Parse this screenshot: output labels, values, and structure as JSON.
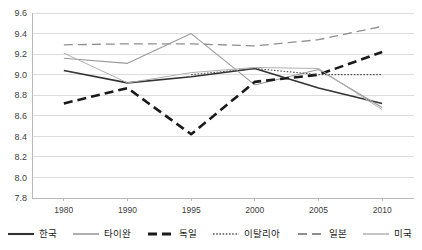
{
  "chart_data": {
    "type": "line",
    "title": "",
    "subtitle": "",
    "xlabel": "",
    "ylabel": "",
    "categories": [
      "1980",
      "1990",
      "1995",
      "2000",
      "2005",
      "2010"
    ],
    "ylim": [
      7.8,
      9.6
    ],
    "ytick_labels": [
      "9.6",
      "9.4",
      "9.2",
      "9.0",
      "8.8",
      "8.6",
      "8.4",
      "8.2",
      "8.0",
      "7.8"
    ],
    "ytick_values": [
      9.6,
      9.4,
      9.2,
      9.0,
      8.8,
      8.6,
      8.4,
      8.2,
      8.0,
      7.8
    ],
    "grid": true,
    "grid_axis": "y",
    "legend_position": "bottom",
    "series": [
      {
        "name": "한국",
        "style": "solid",
        "color": "#333333",
        "width": 1.6,
        "values": [
          9.04,
          8.92,
          8.98,
          9.06,
          8.87,
          8.72
        ]
      },
      {
        "name": "타이완",
        "style": "solid",
        "color": "#9a9a9a",
        "width": 1.1,
        "values": [
          9.16,
          9.11,
          9.4,
          8.9,
          9.05,
          8.68
        ]
      },
      {
        "name": "독일",
        "style": "dashed-heavy",
        "color": "#1a1a1a",
        "width": 2.6,
        "values": [
          8.72,
          8.87,
          8.42,
          8.93,
          9.0,
          9.22
        ]
      },
      {
        "name": "이탈리아",
        "style": "dotted",
        "color": "#555555",
        "width": 1.1,
        "values": [
          null,
          null,
          9.0,
          9.06,
          9.0,
          9.0
        ]
      },
      {
        "name": "일본",
        "style": "dashed-light",
        "color": "#8f8f8f",
        "width": 1.3,
        "values": [
          9.29,
          9.3,
          9.3,
          9.28,
          9.34,
          9.47
        ]
      },
      {
        "name": "미국",
        "style": "solid-thin",
        "color": "#b0b0b0",
        "width": 1.0,
        "values": [
          9.21,
          8.92,
          9.02,
          9.07,
          9.06,
          8.66
        ]
      }
    ]
  },
  "legend": {
    "items": [
      {
        "label": "한국",
        "swatch": "legend-swatch-solid"
      },
      {
        "label": "타이완",
        "swatch": "legend-swatch-solid-light"
      },
      {
        "label": "독일",
        "swatch": "legend-swatch-dashed-heavy"
      },
      {
        "label": "이탈리아",
        "swatch": "legend-swatch-dotted"
      },
      {
        "label": "일본",
        "swatch": "legend-swatch-dashed-light"
      },
      {
        "label": "미국",
        "swatch": "legend-swatch-solid-thin"
      }
    ]
  },
  "colors": {
    "plot_border": "#b9b9b9",
    "gridline": "#dcdcdc",
    "background": "#ffffff",
    "tick_text": "#404040"
  }
}
